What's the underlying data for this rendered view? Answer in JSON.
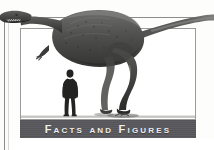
{
  "figure": {
    "banner_label": "Facts and Figures",
    "banner_bg_color": "#57575c",
    "banner_text_color": "#f1f1ef",
    "frame_color": "#8c8c8c",
    "panel_bg_color": "#ffffff",
    "page_bg_color": "#fdfdfb"
  },
  "illustration": {
    "subject": "tyrannosaur-dinosaur",
    "scale_figure": "human-silhouette",
    "dino_fill": "#4a4a4a",
    "dino_shadow": "#2e2e2e",
    "human_fill": "#2a2a2a",
    "ground_shadow": "#6f6f6f"
  }
}
